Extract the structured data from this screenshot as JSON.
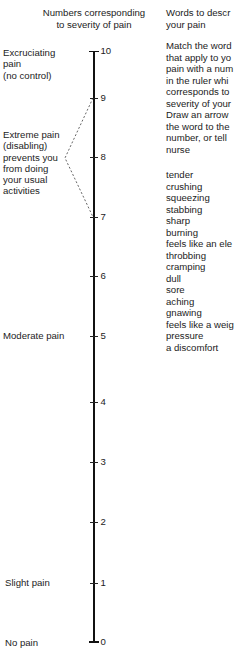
{
  "scale_header": {
    "line1": "Numbers corresponding",
    "line2": "to severity of pain"
  },
  "words_header": {
    "line1": "Words to descr",
    "line2": "your pain"
  },
  "instructions": [
    "Match the word",
    "that apply to yo",
    "pain with a num",
    "in the ruler whi",
    "corresponds to",
    "severity of your",
    "Draw an arrow",
    "the word to the",
    "number, or tell",
    "nurse"
  ],
  "pain_words": [
    "tender",
    "crushing",
    "squeezing",
    "stabbing",
    "sharp",
    "burning",
    "feels like an ele",
    "throbbing",
    "cramping",
    "dull",
    "sore",
    "aching",
    "gnawing",
    "feels like a weig",
    "pressure",
    "a discomfort"
  ],
  "severity_labels": {
    "excruciating": [
      "Excruciating",
      "pain",
      "(no control)"
    ],
    "extreme": [
      "Extreme pain",
      "(disabling)",
      "prevents you",
      "from doing",
      "your usual",
      "activities"
    ],
    "moderate": "Moderate pain",
    "slight": "Slight pain",
    "none": "No pain"
  },
  "scale": {
    "min": 0,
    "max": 10,
    "ticks": [
      "10",
      "9",
      "8",
      "7",
      "6",
      "5",
      "4",
      "3",
      "2",
      "1",
      "0"
    ],
    "bracket_range": [
      "7",
      "9"
    ]
  },
  "colors": {
    "ink": "#1c1c1c",
    "ruler": "#111111",
    "bracket": "#555555",
    "background": "#ffffff"
  }
}
